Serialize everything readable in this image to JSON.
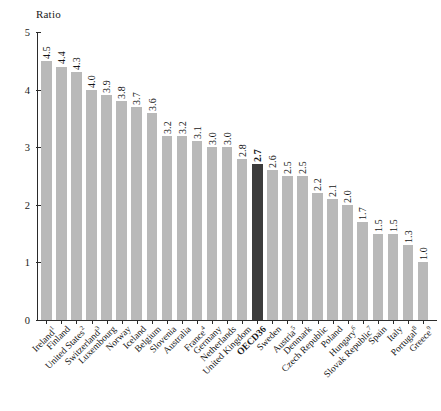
{
  "chart_data": {
    "type": "bar",
    "title": "",
    "ylabel": "Ratio",
    "xlabel": "",
    "ylim": [
      0,
      5
    ],
    "ytick_labels": [
      "0",
      "1",
      "2",
      "3",
      "4",
      "5"
    ],
    "ytick_values": [
      0,
      1,
      2,
      3,
      4,
      5
    ],
    "grid": false,
    "legend": "none",
    "highlight_category": "OECD36",
    "colors": {
      "bar": "#b9b9b9",
      "highlight_bar": "#3c3c3c",
      "axis": "#2b2b2b",
      "text": "#161616",
      "background": "#ffffff"
    },
    "categories": [
      "Ireland",
      "Finland",
      "United States",
      "Switzerland",
      "Luxembourg",
      "Norway",
      "Iceland",
      "Belgium",
      "Slovenia",
      "Australia",
      "France",
      "Germany",
      "Netherlands",
      "United Kingdom",
      "OECD36",
      "Sweden",
      "Austria",
      "Denmark",
      "Czech Republic",
      "Poland",
      "Hungary",
      "Slovak Republic",
      "Spain",
      "Italy",
      "Portugal",
      "Greece"
    ],
    "category_footnotes": [
      "1",
      "",
      "2",
      "3",
      "",
      "",
      "",
      "",
      "",
      "",
      "4",
      "",
      "",
      "",
      "",
      "",
      "5",
      "",
      "",
      "",
      "6",
      "7",
      "",
      "",
      "8",
      "9"
    ],
    "values": [
      4.5,
      4.4,
      4.3,
      4.0,
      3.9,
      3.8,
      3.7,
      3.6,
      3.2,
      3.2,
      3.1,
      3.0,
      3.0,
      2.8,
      2.7,
      2.6,
      2.5,
      2.5,
      2.2,
      2.1,
      2.0,
      1.7,
      1.5,
      1.5,
      1.3,
      1.0
    ],
    "value_labels": [
      "4.5",
      "4.4",
      "4.3",
      "4.0",
      "3.9",
      "3.8",
      "3.7",
      "3.6",
      "3.2",
      "3.2",
      "3.1",
      "3.0",
      "3.0",
      "2.8",
      "2.7",
      "2.6",
      "2.5",
      "2.5",
      "2.2",
      "2.1",
      "2.0",
      "1.7",
      "1.5",
      "1.5",
      "1.3",
      "1.0"
    ]
  }
}
